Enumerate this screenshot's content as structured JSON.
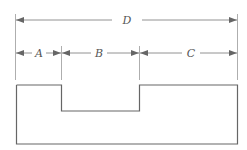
{
  "diagram": {
    "type": "dimensioned-profile",
    "labels": {
      "overall": "D",
      "segment_a": "A",
      "segment_b": "B",
      "segment_c": "C"
    },
    "colors": {
      "line": "#777777",
      "shape": "#666666",
      "label": "#555555",
      "background": "#ffffff"
    }
  }
}
